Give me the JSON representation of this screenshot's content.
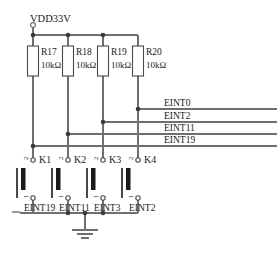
{
  "diagram": {
    "type": "circuit-schematic",
    "supply": {
      "name": "VDD33V",
      "terminal": "open-circle"
    },
    "ground": {
      "symbol": "earth-ground",
      "bars": 3
    },
    "resistors": [
      {
        "ref": "R17",
        "value": "10kΩ"
      },
      {
        "ref": "R18",
        "value": "10kΩ"
      },
      {
        "ref": "R19",
        "value": "10kΩ"
      },
      {
        "ref": "R20",
        "value": "10kΩ"
      }
    ],
    "switches": [
      {
        "ref": "K1",
        "pin_top": "2",
        "pin_bottom": "1",
        "net": "EINT19"
      },
      {
        "ref": "K2",
        "pin_top": "2",
        "pin_bottom": "1",
        "net": "EINT11"
      },
      {
        "ref": "K3",
        "pin_top": "2",
        "pin_bottom": "1",
        "net": "EINT3"
      },
      {
        "ref": "K4",
        "pin_top": "2",
        "pin_bottom": "1",
        "net": "EINT2"
      }
    ],
    "rails": [
      {
        "name": "EINT0"
      },
      {
        "name": "EINT2"
      },
      {
        "name": "EINT11"
      },
      {
        "name": "EINT19"
      }
    ],
    "bottom_nets": [
      "EINT19",
      "EINT11",
      "EINT3",
      "EINT2"
    ],
    "colors": {
      "wire": "#6f6f6f",
      "outline": "#4a4a4a",
      "text": "#1a1a1a",
      "background": "#ffffff"
    }
  }
}
